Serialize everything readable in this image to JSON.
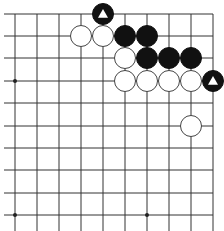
{
  "board": {
    "description": "Go problem diagram, top-right corner section",
    "columns_x": [
      15,
      37,
      59,
      81,
      103,
      125,
      147,
      169,
      191,
      213
    ],
    "rows_y": [
      14,
      36,
      58,
      81,
      103,
      126,
      148,
      170,
      193,
      215
    ],
    "left_extends": true,
    "bottom_extends": true,
    "line_color": "#333333",
    "star_points": [
      [
        0,
        3
      ],
      [
        0,
        9
      ],
      [
        6,
        9
      ]
    ],
    "stone_radius": 10.5
  },
  "stones": [
    {
      "color": "black",
      "col": 4,
      "row": 0,
      "marker": "triangle"
    },
    {
      "color": "white",
      "col": 3,
      "row": 1
    },
    {
      "color": "white",
      "col": 4,
      "row": 1
    },
    {
      "color": "black",
      "col": 5,
      "row": 1
    },
    {
      "color": "black",
      "col": 6,
      "row": 1
    },
    {
      "color": "white",
      "col": 5,
      "row": 2
    },
    {
      "color": "black",
      "col": 6,
      "row": 2
    },
    {
      "color": "black",
      "col": 7,
      "row": 2
    },
    {
      "color": "black",
      "col": 8,
      "row": 2
    },
    {
      "color": "white",
      "col": 5,
      "row": 3
    },
    {
      "color": "white",
      "col": 6,
      "row": 3
    },
    {
      "color": "white",
      "col": 7,
      "row": 3
    },
    {
      "color": "white",
      "col": 8,
      "row": 3
    },
    {
      "color": "black",
      "col": 9,
      "row": 3,
      "marker": "triangle"
    },
    {
      "color": "white",
      "col": 8,
      "row": 5
    }
  ]
}
